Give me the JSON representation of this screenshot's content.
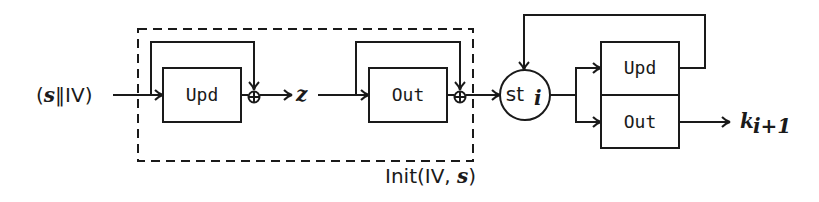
{
  "diagram": {
    "input_label": {
      "open": "(",
      "s": "s",
      "concat": "‖IV)"
    },
    "init_block": {
      "label_prefix": "Init(IV, ",
      "label_s": "s",
      "label_suffix": ")",
      "update_box": "Upd",
      "output_box": "Out",
      "intermediate_label": "z",
      "xor_symbol": "⊕"
    },
    "state_node": {
      "label": "st",
      "subscript": "i"
    },
    "stream_block": {
      "update_box": "Upd",
      "output_box": "Out"
    },
    "output_label": {
      "k": "k",
      "subscript": "i+1"
    },
    "colors": {
      "stroke": "#1a1a1a",
      "background": "#ffffff"
    }
  }
}
